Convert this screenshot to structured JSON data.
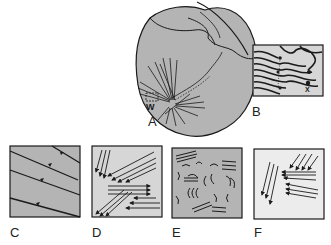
{
  "figure": {
    "panels": [
      {
        "id": "A",
        "label": "A",
        "description": "Heart outline with trabecular fiber bundles",
        "marker": "W"
      },
      {
        "id": "B",
        "label": "B",
        "description": "Wavy fiber tracts with nodes",
        "markers": [
          "Y",
          "Y",
          "Y",
          "Y",
          "X"
        ]
      },
      {
        "id": "C",
        "label": "C",
        "description": "Parallel oblique lines with arrowheads"
      },
      {
        "id": "D",
        "label": "D",
        "description": "Groups of parallel arrows in different directions"
      },
      {
        "id": "E",
        "label": "E",
        "description": "Disorganized curved and short line fragments"
      },
      {
        "id": "F",
        "label": "F",
        "description": "Sparse arrow groups on light background"
      }
    ]
  },
  "colors": {
    "panel_fill_gray": "#b4b4b4",
    "panel_fill_light": "#ececec",
    "stroke": "#1a1a1a",
    "background": "#ffffff"
  }
}
